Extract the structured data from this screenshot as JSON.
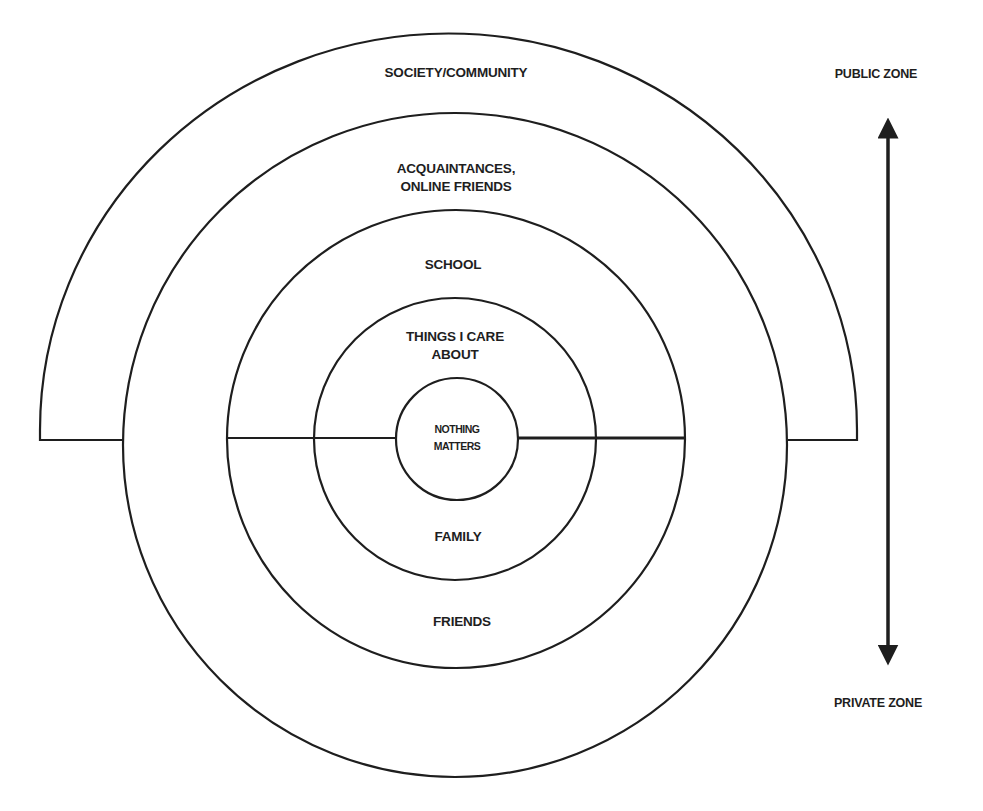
{
  "diagram": {
    "rings": {
      "outer_arc": {
        "label": "SOCIETY/COMMUNITY"
      },
      "ring4": {
        "label_line1": "ACQUAINTANCES,",
        "label_line2": "ONLINE FRIENDS"
      },
      "ring3_top": {
        "label": "SCHOOL"
      },
      "ring3_bottom": {
        "label": "FRIENDS"
      },
      "ring2_top": {
        "label_line1": "THINGS I CARE",
        "label_line2": "ABOUT"
      },
      "ring2_bottom": {
        "label": "FAMILY"
      },
      "core": {
        "label_line1": "NOTHING",
        "label_line2": "MATTERS"
      }
    },
    "axis": {
      "top_label": "PUBLIC ZONE",
      "bottom_label": "PRIVATE ZONE"
    },
    "colors": {
      "stroke": "#1e1e1e",
      "background": "#ffffff"
    }
  }
}
